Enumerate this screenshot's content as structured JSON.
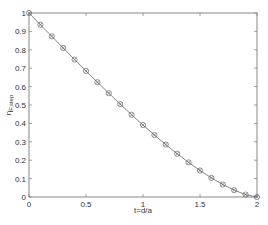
{
  "chart_data": {
    "type": "line",
    "title": "",
    "xlabel": "t=d/a",
    "ylabel": "η_{F,step}",
    "ylabel_main": "η",
    "ylabel_sub": "F,step",
    "xlim": [
      0,
      2
    ],
    "ylim": [
      0,
      1
    ],
    "xticks": [
      0,
      0.5,
      1,
      1.5,
      2
    ],
    "xtick_labels": [
      "0",
      "0.5",
      "1",
      "1.5",
      "2"
    ],
    "yticks": [
      0,
      0.1,
      0.2,
      0.3,
      0.4,
      0.5,
      0.6,
      0.7,
      0.8,
      0.9,
      1
    ],
    "ytick_labels": [
      "0",
      "0.1",
      "0.2",
      "0.3",
      "0.4",
      "0.5",
      "0.6",
      "0.7",
      "0.8",
      "0.9",
      "1"
    ],
    "grid": false,
    "legend": null,
    "series": [
      {
        "name": "curve",
        "style": "solid line with circle-cross markers",
        "color": "#777777",
        "x": [
          0,
          0.1,
          0.2,
          0.3,
          0.4,
          0.5,
          0.6,
          0.7,
          0.8,
          0.9,
          1.0,
          1.1,
          1.2,
          1.3,
          1.4,
          1.5,
          1.6,
          1.7,
          1.8,
          1.9,
          2.0
        ],
        "values": [
          1.0,
          0.936,
          0.873,
          0.81,
          0.747,
          0.685,
          0.624,
          0.564,
          0.505,
          0.447,
          0.391,
          0.337,
          0.285,
          0.235,
          0.188,
          0.144,
          0.104,
          0.068,
          0.037,
          0.013,
          0.0
        ]
      }
    ]
  },
  "colors": {
    "axis": "#888888",
    "line": "#777777",
    "marker": "#666666",
    "text": "#333333"
  }
}
